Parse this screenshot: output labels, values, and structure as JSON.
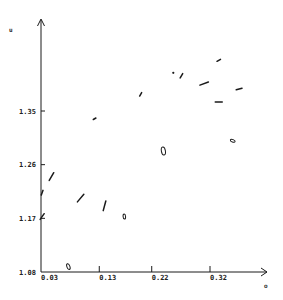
{
  "chart_data": {
    "type": "scatter",
    "title": "",
    "xlabel": "o",
    "ylabel": "u",
    "xlim": [
      0.03,
      0.39
    ],
    "ylim": [
      1.08,
      1.44
    ],
    "grid": false,
    "legend": null,
    "x_ticks": [
      "0.03",
      "0.13",
      "0.22",
      "0.32"
    ],
    "y_ticks": [
      "1.08",
      "1.17",
      "1.26",
      "1.35"
    ],
    "x_tick_values": [
      0.03,
      0.13,
      0.22,
      0.32
    ],
    "y_tick_values": [
      1.08,
      1.17,
      1.26,
      1.35
    ],
    "series": [
      {
        "name": "glyphs",
        "marker": "oriented-dash/ellipse",
        "points": [
          {
            "x": 0.335,
            "y": 1.435,
            "shape": "dash",
            "angle": -30,
            "len": 4
          },
          {
            "x": 0.257,
            "y": 1.414,
            "shape": "dot",
            "angle": 0,
            "len": 2
          },
          {
            "x": 0.271,
            "y": 1.409,
            "shape": "dash",
            "angle": -60,
            "len": 5
          },
          {
            "x": 0.31,
            "y": 1.396,
            "shape": "dash",
            "angle": -20,
            "len": 9
          },
          {
            "x": 0.37,
            "y": 1.387,
            "shape": "dash",
            "angle": -15,
            "len": 6
          },
          {
            "x": 0.201,
            "y": 1.378,
            "shape": "dash",
            "angle": -60,
            "len": 4
          },
          {
            "x": 0.335,
            "y": 1.365,
            "shape": "dash",
            "angle": 0,
            "len": 7
          },
          {
            "x": 0.122,
            "y": 1.337,
            "shape": "dash",
            "angle": -30,
            "len": 3
          },
          {
            "x": 0.359,
            "y": 1.3,
            "shape": "ellipse",
            "angle": 20,
            "len": 5
          },
          {
            "x": 0.24,
            "y": 1.283,
            "shape": "ellipse",
            "angle": 80,
            "len": 8
          },
          {
            "x": 0.048,
            "y": 1.24,
            "shape": "dash",
            "angle": -60,
            "len": 9
          },
          {
            "x": 0.032,
            "y": 1.213,
            "shape": "dash",
            "angle": -70,
            "len": 5
          },
          {
            "x": 0.098,
            "y": 1.204,
            "shape": "dash",
            "angle": -50,
            "len": 10
          },
          {
            "x": 0.139,
            "y": 1.191,
            "shape": "dash",
            "angle": -75,
            "len": 10
          },
          {
            "x": 0.032,
            "y": 1.173,
            "shape": "dash",
            "angle": -55,
            "len": 7
          },
          {
            "x": 0.173,
            "y": 1.173,
            "shape": "ellipse",
            "angle": 85,
            "len": 5
          },
          {
            "x": 0.077,
            "y": 1.089,
            "shape": "ellipse",
            "angle": 70,
            "len": 6
          }
        ]
      }
    ]
  },
  "colors": {
    "ink": "#1a1a1a",
    "background": "#ffffff"
  }
}
